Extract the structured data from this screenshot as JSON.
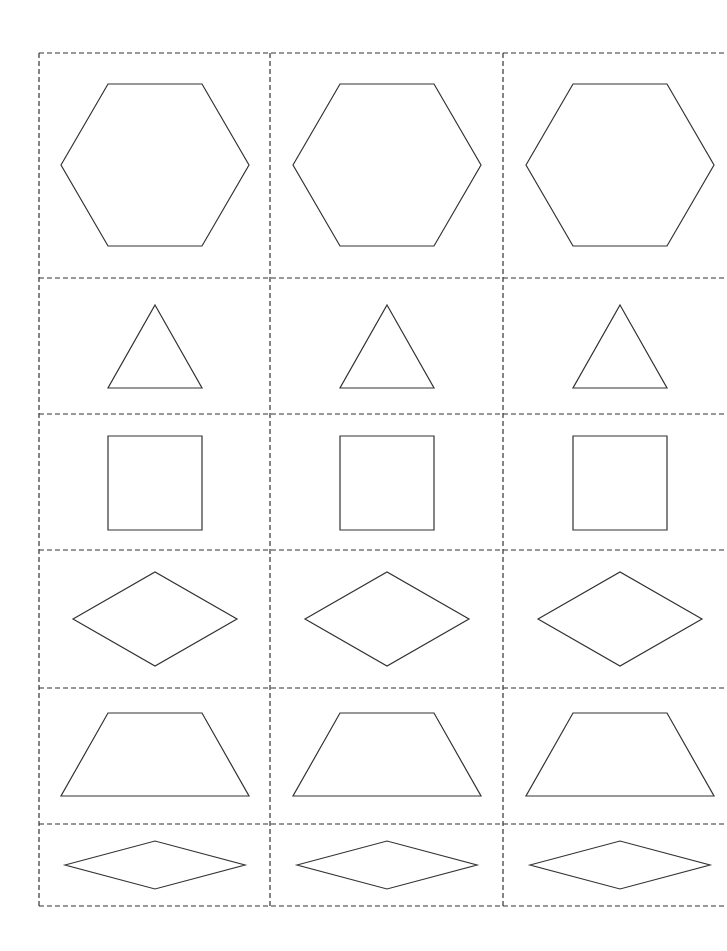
{
  "sheet": {
    "title": "Pattern block cut-out sheet",
    "grid": {
      "x_lines": [
        39,
        270,
        503,
        727
      ],
      "y_lines": [
        53,
        278,
        414,
        550,
        688,
        824,
        906
      ],
      "stroke_color": "#333333",
      "style": "dashed"
    },
    "rows": [
      {
        "shape": "hexagon",
        "points": [
          [
            -94,
            0
          ],
          [
            -47,
            -81
          ],
          [
            47,
            -81
          ],
          [
            94,
            0
          ],
          [
            47,
            81
          ],
          [
            -47,
            81
          ]
        ],
        "cy": 165
      },
      {
        "shape": "triangle",
        "points": [
          [
            0,
            -47
          ],
          [
            47,
            36
          ],
          [
            -47,
            36
          ]
        ],
        "cy": 352
      },
      {
        "shape": "square",
        "points": [
          [
            -47,
            -47
          ],
          [
            47,
            -47
          ],
          [
            47,
            47
          ],
          [
            -47,
            47
          ]
        ],
        "cy": 483
      },
      {
        "shape": "rhombus",
        "points": [
          [
            -82,
            0
          ],
          [
            0,
            -47
          ],
          [
            82,
            0
          ],
          [
            0,
            47
          ]
        ],
        "cy": 619
      },
      {
        "shape": "trapezoid",
        "points": [
          [
            -47,
            -43
          ],
          [
            47,
            -43
          ],
          [
            94,
            40
          ],
          [
            -94,
            40
          ]
        ],
        "cy": 756
      },
      {
        "shape": "thin-rhombus",
        "points": [
          [
            -90,
            0
          ],
          [
            0,
            -24
          ],
          [
            90,
            0
          ],
          [
            0,
            24
          ]
        ],
        "cy": 865
      }
    ],
    "column_centers": [
      155,
      387,
      620
    ]
  }
}
